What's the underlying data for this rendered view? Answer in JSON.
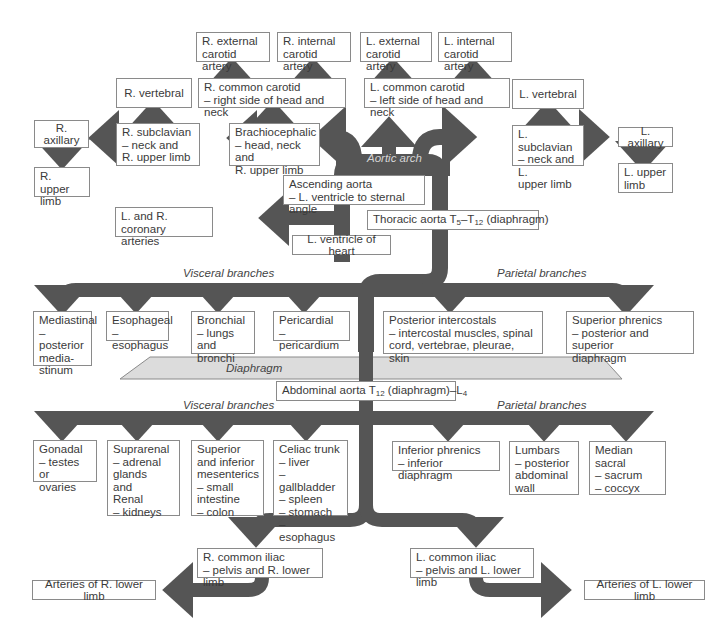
{
  "diagram": {
    "colors": {
      "artery": "#555555",
      "diaphragm": "#dcdcdc",
      "box_border": "#8a8a8a",
      "text": "#3a3a3a"
    },
    "labels": {
      "aortic_arch": "Aortic arch",
      "thoracic_visceral": "Visceral branches",
      "thoracic_parietal": "Parietal branches",
      "diaphragm": "Diaphragm",
      "abdominal_visceral": "Visceral branches",
      "abdominal_parietal": "Parietal branches"
    },
    "head_neck": {
      "r_external_carotid": "R. external\ncarotid artery",
      "r_internal_carotid": "R. internal\ncarotid artery",
      "l_external_carotid": "L. external\ncarotid artery",
      "l_internal_carotid": "L. internal\ncarotid artery",
      "r_vertebral": "R. vertebral",
      "r_common_carotid": "R. common carotid\n– right side of head and neck",
      "l_common_carotid": "L. common carotid\n– left side of head and neck",
      "l_vertebral": "L. vertebral",
      "r_axillary": "R. axillary",
      "r_subclavian": "R. subclavian\n– neck and\n   R. upper  limb",
      "brachiocephalic": "Brachiocephalic\n– head, neck and\n   R. upper limb",
      "l_subclavian": "L. subclavian\n– neck and L.\n   upper limb",
      "l_axillary": "L. axillary",
      "r_upper_limb": "R. upper\nlimb",
      "l_upper_limb": "L. upper\nlimb"
    },
    "thorax": {
      "ascending_aorta": "Ascending aorta\n– L. ventricle to sternal angle",
      "coronary": "L. and R. coronary\narteries",
      "l_ventricle": "L. ventricle of heart",
      "thoracic_aorta_prefix": "Thoracic aorta T",
      "thoracic_aorta_sub1": "5",
      "thoracic_aorta_mid": "–T",
      "thoracic_aorta_sub2": "12",
      "thoracic_aorta_suffix": " (diaphragm)",
      "visceral": [
        "Mediastinal\n– posterior\n   media-\n   stinum",
        "Esophageal\n– esophagus",
        "Bronchial\n– lungs and\n   bronchi",
        "Pericardial\n– pericardium"
      ],
      "parietal": [
        "Posterior intercostals\n– intercostal muscles, spinal\n   cord, vertebrae, pleurae, skin",
        "Superior phrenics\n– posterior and superior\n   diaphragm"
      ]
    },
    "abdomen": {
      "abdominal_aorta_prefix": "Abdominal aorta T",
      "abdominal_aorta_sub1": "12",
      "abdominal_aorta_mid": " (diaphragm)–L",
      "abdominal_aorta_sub2": "4",
      "visceral": [
        "Gonadal\n– testes or\n   ovaries",
        "Suprarenal\n– adrenal\n   glands\n   and\nRenal\n– kidneys",
        "Superior\nand inferior\nmesenterics\n– small\n   intestine\n– colon",
        "Celiac trunk\n– liver\n– gallbladder\n– spleen\n– stomach\n– esophagus"
      ],
      "parietal": [
        "Inferior phrenics\n– inferior diaphragm",
        "Lumbars\n– posterior\n   abdominal\n   wall",
        "Median sacral\n– sacrum\n– coccyx"
      ]
    },
    "pelvis": {
      "r_common_iliac": "R. common iliac\n– pelvis and R. lower limb",
      "l_common_iliac": "L. common iliac\n– pelvis and L. lower limb",
      "r_lower_limb": "Arteries of R. lower limb",
      "l_lower_limb": "Arteries of L. lower limb"
    }
  }
}
